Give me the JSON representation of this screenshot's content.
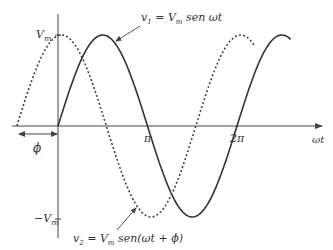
{
  "figure": {
    "colors": {
      "curve": "#333333",
      "axis": "#444444",
      "background": "#ffffff"
    }
  },
  "axes": {
    "x_label": "ωt",
    "x_ticks": [
      "π",
      "2π"
    ],
    "y_ticks": [
      "V",
      "−V"
    ],
    "y_tick_sub": "m",
    "phase_label": "ϕ"
  },
  "curves": {
    "v1": {
      "style": "solid",
      "label_v": "v",
      "label_sub": "1",
      "label_eq": " = ",
      "label_V": "V",
      "label_Vsub": "m",
      "label_rest": " sen ωt"
    },
    "v2": {
      "style": "dotted",
      "label_v": "v",
      "label_sub": "2",
      "label_eq": " = ",
      "label_V": "V",
      "label_Vsub": "m",
      "label_rest": " sen(ωt + ϕ)"
    }
  },
  "chart_data": {
    "type": "line",
    "title": "",
    "xlabel": "ωt",
    "ylabel": "",
    "x_ticks": [
      "π",
      "2π"
    ],
    "y_ticks": [
      "Vm",
      "−Vm"
    ],
    "series": [
      {
        "name": "v1 = Vm sen ωt",
        "style": "solid",
        "amplitude": 1,
        "phase": 0,
        "x_range": [
          0,
          2.6
        ]
      },
      {
        "name": "v2 = Vm sen(ωt + ϕ)",
        "style": "dotted",
        "amplitude": 1,
        "phase": 0.46,
        "x_range": [
          -0.46,
          2.2
        ]
      }
    ],
    "x_units": "π rad",
    "ylim": [
      -1,
      1
    ]
  }
}
